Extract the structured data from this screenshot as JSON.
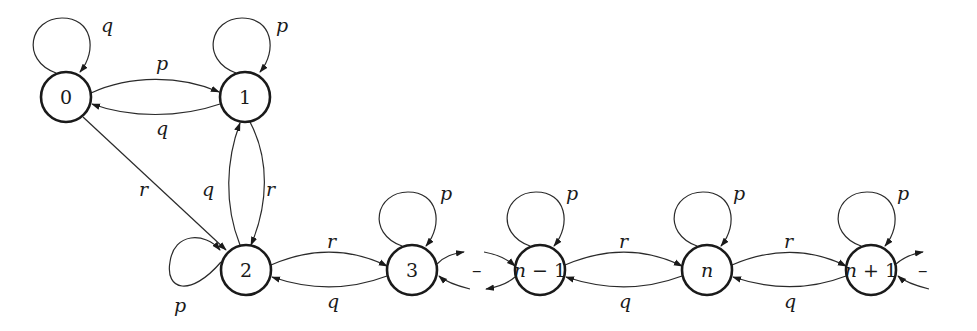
{
  "diagram": {
    "type": "state-transition-graph",
    "nodes": [
      {
        "id": "0",
        "label": "0"
      },
      {
        "id": "1",
        "label": "1"
      },
      {
        "id": "2",
        "label": "2"
      },
      {
        "id": "3",
        "label": "3"
      },
      {
        "id": "n-1",
        "label": "n − 1"
      },
      {
        "id": "n",
        "label": "n"
      },
      {
        "id": "n+1",
        "label": "n + 1"
      }
    ],
    "edges": [
      {
        "from": "0",
        "to": "0",
        "label": "q"
      },
      {
        "from": "0",
        "to": "1",
        "label": "p"
      },
      {
        "from": "1",
        "to": "0",
        "label": "q"
      },
      {
        "from": "1",
        "to": "1",
        "label": "p"
      },
      {
        "from": "0",
        "to": "2",
        "label": "r"
      },
      {
        "from": "1",
        "to": "2",
        "label": "r"
      },
      {
        "from": "2",
        "to": "1",
        "label": "q"
      },
      {
        "from": "2",
        "to": "2",
        "label": "p"
      },
      {
        "from": "2",
        "to": "3",
        "label": "r"
      },
      {
        "from": "3",
        "to": "2",
        "label": "q"
      },
      {
        "from": "3",
        "to": "3",
        "label": "p"
      },
      {
        "from": "n-1",
        "to": "n-1",
        "label": "p"
      },
      {
        "from": "n-1",
        "to": "n",
        "label": "r"
      },
      {
        "from": "n",
        "to": "n-1",
        "label": "q"
      },
      {
        "from": "n",
        "to": "n",
        "label": "p"
      },
      {
        "from": "n",
        "to": "n+1",
        "label": "r"
      },
      {
        "from": "n+1",
        "to": "n",
        "label": "q"
      },
      {
        "from": "n+1",
        "to": "n+1",
        "label": "p"
      }
    ],
    "continuation_marks": [
      "–",
      "–",
      "–"
    ]
  },
  "labels": {
    "node0": "0",
    "node1": "1",
    "node2": "2",
    "node3": "3",
    "nodeNm1_n": "n",
    "nodeNm1_rest": " − 1",
    "nodeN": "n",
    "nodeNp1_n": "n",
    "nodeNp1_rest": " + 1",
    "e_0_0": "q",
    "e_0_1": "p",
    "e_1_0": "q",
    "e_1_1": "p",
    "e_0_2": "r",
    "e_2_1": "q",
    "e_1_2": "r",
    "e_2_2": "p",
    "e_2_3": "r",
    "e_3_2": "q",
    "e_3_3": "p",
    "e_nm1_nm1": "p",
    "e_nm1_n": "r",
    "e_n_nm1": "q",
    "e_n_n": "p",
    "e_n_np1": "r",
    "e_np1_n": "q",
    "e_np1_np1": "p",
    "dash1": "–",
    "dash2": "–",
    "dash3": "–"
  }
}
